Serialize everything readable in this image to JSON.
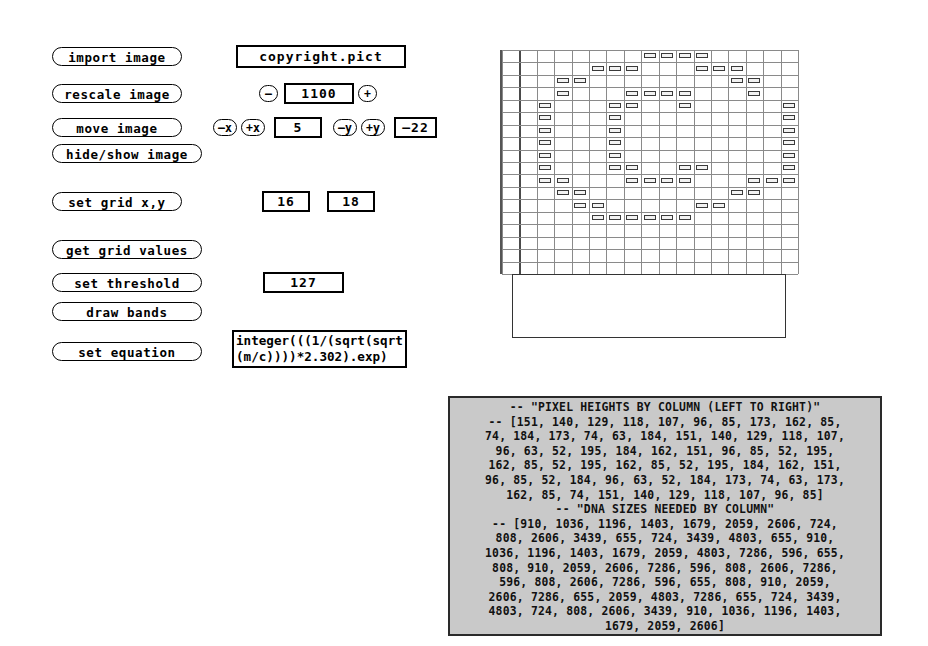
{
  "controls": {
    "import_image": "import image",
    "rescale_image": "rescale image",
    "move_image": "move image",
    "hide_show_image": "hide/show image",
    "set_grid": "set grid x,y",
    "get_grid_values": "get grid values",
    "set_threshold": "set threshold",
    "draw_bands": "draw bands",
    "set_equation": "set equation"
  },
  "fields": {
    "filename": "copyright.pict",
    "scale_value": "1100",
    "scale_minus": "–",
    "scale_plus": "+",
    "move_minus_x": "–x",
    "move_plus_x": "+x",
    "move_x_value": "5",
    "move_minus_y": "–y",
    "move_plus_y": "+y",
    "move_y_value": "–22",
    "grid_x": "16",
    "grid_y": "18",
    "threshold": "127",
    "equation": "integer(((1/(sqrt(sqrt(m/c))))*2.302).exp)"
  },
  "console": {
    "lines": [
      "-- \"PIXEL HEIGHTS BY COLUMN (LEFT TO RIGHT)\"",
      "-- [151, 140, 129, 118, 107, 96, 85, 173, 162, 85,",
      "74, 184, 173, 74, 63, 184, 151, 140, 129, 118, 107,",
      "96, 63, 52, 195, 184, 162, 151, 96, 85, 52, 195,",
      "162, 85, 52, 195, 162, 85, 52, 195, 184, 162, 151,",
      "96, 85, 52, 184, 96, 63, 52, 184, 173, 74, 63, 173,",
      "162, 85, 74, 151, 140, 129, 118, 107, 96, 85]",
      "-- \"DNA SIZES NEEDED BY COLUMN\"",
      "-- [910, 1036, 1196, 1403, 1679, 2059, 2606, 724,",
      "808, 2606, 3439, 655, 724, 3439, 4803, 655, 910,",
      "1036, 1196, 1403, 1679, 2059, 4803, 7286, 596, 655,",
      "808, 910, 2059, 2606, 7286, 596, 808, 2606, 7286,",
      "596, 808, 2606, 7286, 596, 655, 808, 910, 2059,",
      "2606, 7286, 655, 2059, 4803, 7286, 655, 724, 3439,",
      "4803, 724, 808, 2606, 3439, 910, 1036, 1196, 1403,",
      "1679, 2059, 2606]"
    ],
    "pixel_heights_title": "-- \"PIXEL HEIGHTS BY COLUMN (LEFT TO RIGHT)\"",
    "dna_sizes_title": "-- \"DNA SIZES NEEDED BY COLUMN\"",
    "pixel_heights": [
      151,
      140,
      129,
      118,
      107,
      96,
      85,
      173,
      162,
      85,
      74,
      184,
      173,
      74,
      63,
      184,
      151,
      140,
      129,
      118,
      107,
      96,
      63,
      52,
      195,
      184,
      162,
      151,
      96,
      85,
      52,
      195,
      162,
      85,
      52,
      195,
      162,
      85,
      52,
      195,
      184,
      162,
      151,
      96,
      85,
      52,
      184,
      96,
      63,
      52,
      184,
      173,
      74,
      63,
      173,
      162,
      85,
      74,
      151,
      140,
      129,
      118,
      107,
      96,
      85
    ],
    "dna_sizes": [
      910,
      1036,
      1196,
      1403,
      1679,
      2059,
      2606,
      724,
      808,
      2606,
      3439,
      655,
      724,
      3439,
      4803,
      655,
      910,
      1036,
      1196,
      1403,
      1679,
      2059,
      4803,
      7286,
      596,
      655,
      808,
      910,
      2059,
      2606,
      7286,
      596,
      808,
      2606,
      7286,
      596,
      808,
      2606,
      7286,
      596,
      655,
      808,
      910,
      2059,
      2606,
      7286,
      655,
      2059,
      4803,
      7286,
      655,
      724,
      3439,
      4803,
      724,
      808,
      2606,
      3439,
      910,
      1036,
      1196,
      1403,
      1679,
      2059,
      2606
    ]
  },
  "grid_preview": {
    "cols": 16,
    "rows": 18,
    "bands_by_row": [
      [
        8,
        9,
        10,
        11
      ],
      [
        5,
        6,
        7,
        11,
        12,
        13
      ],
      [
        3,
        4,
        13,
        14
      ],
      [
        3,
        7,
        8,
        9,
        10,
        14
      ],
      [
        2,
        6,
        7,
        10,
        16
      ],
      [
        2,
        6,
        16
      ],
      [
        2,
        6,
        16
      ],
      [
        2,
        6,
        16
      ],
      [
        2,
        6,
        16
      ],
      [
        2,
        6,
        7,
        10,
        11,
        16
      ],
      [
        2,
        3,
        7,
        8,
        9,
        10,
        14,
        15,
        16
      ],
      [
        3,
        4,
        13,
        14
      ],
      [
        4,
        5,
        11,
        12
      ],
      [
        5,
        6,
        7,
        8,
        9,
        10
      ]
    ],
    "colors": {
      "band_border": "#3a3a3a",
      "band_fill": "#f2f2f2",
      "grid_line": "#8a8a8a",
      "major_line": "#4a4a4a"
    }
  }
}
